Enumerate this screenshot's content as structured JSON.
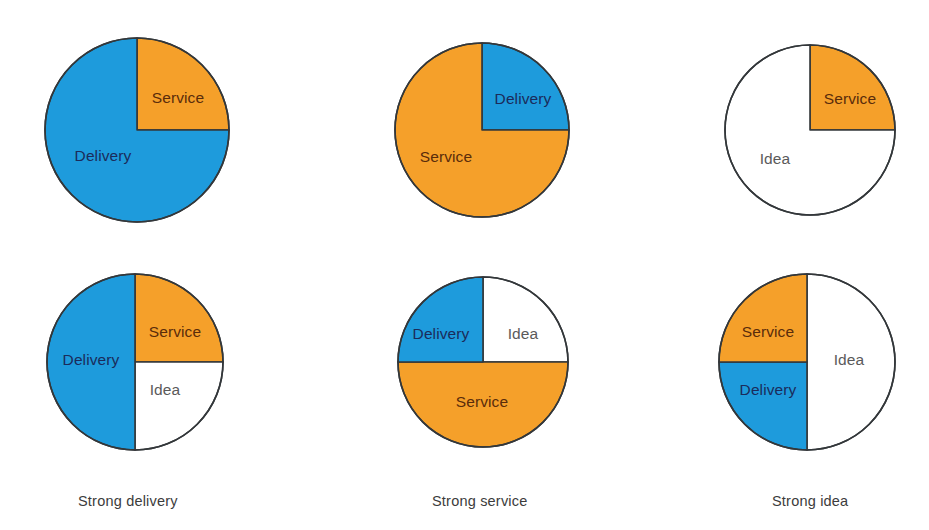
{
  "figure": {
    "background_color": "#ffffff",
    "width": 929,
    "height": 530
  },
  "palette": {
    "blue": "#1E9BDC",
    "orange": "#F5A02A",
    "white": "#FFFFFF",
    "outline": "#33373A",
    "label_on_blue": "#1B2B5B",
    "label_on_orange": "#5A2C0B",
    "label_on_white": "#5A5A5A",
    "caption_color": "#3C3C3C"
  },
  "captions": [
    {
      "id": "caption-strong-delivery",
      "text": "Strong delivery",
      "x": 78,
      "y": 493
    },
    {
      "id": "caption-strong-service",
      "text": "Strong service",
      "x": 432,
      "y": 493
    },
    {
      "id": "caption-strong-idea",
      "text": "Strong idea",
      "x": 772,
      "y": 493
    }
  ],
  "chart_data": {
    "type": "pie",
    "title": "",
    "subtitle": "",
    "xlabel": "",
    "ylabel": "",
    "legend_position": "none",
    "grid": false,
    "category_colors": {
      "Delivery": "#1E9BDC",
      "Service": "#F5A02A",
      "Idea": "#FFFFFF"
    },
    "charts": [
      {
        "id": "pie-top-left",
        "row": 0,
        "col": 0,
        "caption": "Strong delivery",
        "center_x": 137,
        "center_y": 130,
        "radius": 92,
        "categories": [
          "Service",
          "Delivery"
        ],
        "values": [
          25,
          75
        ],
        "slices": [
          {
            "label": "Service",
            "value": 25,
            "start_deg": 0,
            "end_deg": 90,
            "fill": "#F5A02A",
            "label_color": "#5A2C0B",
            "label_x": 178,
            "label_y": 99
          },
          {
            "label": "Delivery",
            "value": 75,
            "start_deg": 90,
            "end_deg": 360,
            "fill": "#1E9BDC",
            "label_color": "#1B2B5B",
            "label_x": 103,
            "label_y": 157
          }
        ]
      },
      {
        "id": "pie-top-middle",
        "row": 0,
        "col": 1,
        "caption": "Strong service",
        "center_x": 482,
        "center_y": 130,
        "radius": 87,
        "categories": [
          "Delivery",
          "Service"
        ],
        "values": [
          25,
          75
        ],
        "slices": [
          {
            "label": "Delivery",
            "value": 25,
            "start_deg": 0,
            "end_deg": 90,
            "fill": "#1E9BDC",
            "label_color": "#1B2B5B",
            "label_x": 523,
            "label_y": 100
          },
          {
            "label": "Service",
            "value": 75,
            "start_deg": 90,
            "end_deg": 360,
            "fill": "#F5A02A",
            "label_color": "#5A2C0B",
            "label_x": 446,
            "label_y": 158
          }
        ]
      },
      {
        "id": "pie-top-right",
        "row": 0,
        "col": 2,
        "caption": "Strong idea",
        "center_x": 810,
        "center_y": 130,
        "radius": 85,
        "categories": [
          "Service",
          "Idea"
        ],
        "values": [
          25,
          75
        ],
        "slices": [
          {
            "label": "Service",
            "value": 25,
            "start_deg": 0,
            "end_deg": 90,
            "fill": "#F5A02A",
            "label_color": "#5A2C0B",
            "label_x": 850,
            "label_y": 100
          },
          {
            "label": "Idea",
            "value": 75,
            "start_deg": 90,
            "end_deg": 360,
            "fill": "#FFFFFF",
            "label_color": "#5A5A5A",
            "label_x": 775,
            "label_y": 160
          }
        ]
      },
      {
        "id": "pie-bottom-left",
        "row": 1,
        "col": 0,
        "caption": "Strong delivery",
        "center_x": 135,
        "center_y": 362,
        "radius": 88,
        "categories": [
          "Service",
          "Idea",
          "Delivery"
        ],
        "values": [
          25,
          25,
          50
        ],
        "slices": [
          {
            "label": "Service",
            "value": 25,
            "start_deg": 0,
            "end_deg": 90,
            "fill": "#F5A02A",
            "label_color": "#5A2C0B",
            "label_x": 175,
            "label_y": 333
          },
          {
            "label": "Idea",
            "value": 25,
            "start_deg": 90,
            "end_deg": 180,
            "fill": "#FFFFFF",
            "label_color": "#5A5A5A",
            "label_x": 165,
            "label_y": 391
          },
          {
            "label": "Delivery",
            "value": 50,
            "start_deg": 180,
            "end_deg": 360,
            "fill": "#1E9BDC",
            "label_color": "#1B2B5B",
            "label_x": 91,
            "label_y": 361
          }
        ]
      },
      {
        "id": "pie-bottom-middle",
        "row": 1,
        "col": 1,
        "caption": "Strong service",
        "center_x": 483,
        "center_y": 362,
        "radius": 85,
        "categories": [
          "Idea",
          "Service",
          "Delivery"
        ],
        "values": [
          25,
          50,
          25
        ],
        "slices": [
          {
            "label": "Idea",
            "value": 25,
            "start_deg": 0,
            "end_deg": 90,
            "fill": "#FFFFFF",
            "label_color": "#5A5A5A",
            "label_x": 523,
            "label_y": 335
          },
          {
            "label": "Service",
            "value": 50,
            "start_deg": 90,
            "end_deg": 270,
            "fill": "#F5A02A",
            "label_color": "#5A2C0B",
            "label_x": 482,
            "label_y": 403
          },
          {
            "label": "Delivery",
            "value": 25,
            "start_deg": 270,
            "end_deg": 360,
            "fill": "#1E9BDC",
            "label_color": "#1B2B5B",
            "label_x": 441,
            "label_y": 335
          }
        ]
      },
      {
        "id": "pie-bottom-right",
        "row": 1,
        "col": 2,
        "caption": "Strong idea",
        "center_x": 807,
        "center_y": 362,
        "radius": 88,
        "categories": [
          "Idea",
          "Delivery",
          "Service"
        ],
        "values": [
          50,
          25,
          25
        ],
        "slices": [
          {
            "label": "Idea",
            "value": 50,
            "start_deg": 0,
            "end_deg": 180,
            "fill": "#FFFFFF",
            "label_color": "#5A5A5A",
            "label_x": 849,
            "label_y": 361
          },
          {
            "label": "Delivery",
            "value": 25,
            "start_deg": 180,
            "end_deg": 270,
            "fill": "#1E9BDC",
            "label_color": "#1B2B5B",
            "label_x": 768,
            "label_y": 391
          },
          {
            "label": "Service",
            "value": 25,
            "start_deg": 270,
            "end_deg": 360,
            "fill": "#F5A02A",
            "label_color": "#5A2C0B",
            "label_x": 768,
            "label_y": 333
          }
        ]
      }
    ]
  }
}
